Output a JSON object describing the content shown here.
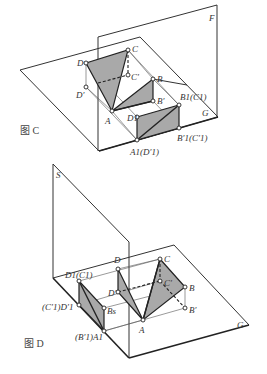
{
  "figure_c": {
    "caption": "图 C",
    "plane_labels": {
      "vertical": "F",
      "horizontal": "G"
    },
    "points": {
      "D": "D",
      "C": "C",
      "C_prime": "C′",
      "B": "B",
      "D_prime": "D′",
      "A": "A",
      "B_prime": "B′",
      "D1": "D1",
      "B1C1": "B1(C1)",
      "B1pC1p": "B′1(C′1)",
      "A1D1p": "A1(D′1)"
    }
  },
  "figure_d": {
    "caption": "图 D",
    "plane_labels": {
      "vertical": "S",
      "horizontal": "G"
    },
    "points": {
      "D1C1": "D1(C1)",
      "C1pD1p": "(C′1)D′1",
      "Bs": "Bs",
      "B1pA1": "(B′1)A1",
      "D": "D",
      "D_prime": "D′",
      "C": "C",
      "C_prime": "C′",
      "B": "B",
      "B_prime": "B′",
      "A": "A"
    }
  },
  "colors": {
    "line": "#222222",
    "shade": "#a9a9a9",
    "background": "#ffffff"
  }
}
